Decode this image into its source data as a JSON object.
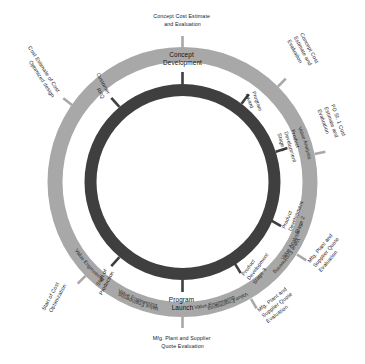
{
  "diagram": {
    "type": "concentric-process-wheel",
    "title": "Concept Cost Estimate and Evaluation",
    "colors": {
      "outer_ring": "#a8a8a8",
      "inner_ring": "#3f3f3f",
      "background": "#ffffff",
      "text": "#1a1a1a"
    },
    "outside_labels": [
      {
        "id": "top",
        "text_lines": [
          "Concept Cost Estimate",
          "and Evaluation"
        ],
        "angle_deg": 0,
        "rotation_deg": 0
      },
      {
        "id": "upper-right",
        "text_lines": [
          "Concept Cost",
          "Estimate and",
          "Evaluation"
        ],
        "angle_deg": 45,
        "rotation_deg": -60
      },
      {
        "id": "right",
        "text_lines": [
          "PD St. 1 Cost",
          "Estimate and",
          "Evaluation"
        ],
        "angle_deg": 78,
        "rotation_deg": -68
      },
      {
        "id": "lower-right",
        "text_lines": [
          "Mfg. Plant and",
          "Supplier Quote",
          "Evaluation"
        ],
        "angle_deg": 122,
        "rotation_deg": 52
      },
      {
        "id": "lower-right-2",
        "text_lines": [
          "Mfg. Plant and",
          "Supplier Quote",
          "Evaluation"
        ],
        "angle_deg": 150,
        "rotation_deg": 40
      },
      {
        "id": "bottom",
        "text_lines": [
          "Mfg. Plant and Supplier",
          "Quote Evaluation"
        ],
        "angle_deg": 180,
        "rotation_deg": 0
      },
      {
        "id": "lower-left",
        "text_lines": [
          "Start of Cost",
          "Optimization"
        ],
        "angle_deg": 224,
        "rotation_deg": -60
      },
      {
        "id": "upper-left",
        "text_lines": [
          "Cost Estimate of Cost",
          "Optimized design"
        ],
        "angle_deg": 305,
        "rotation_deg": 55
      }
    ],
    "outer_ring_labels": [
      {
        "text": "Value Engineering",
        "angle_deg": 28
      },
      {
        "text": "Value Engineering",
        "angle_deg": 62
      },
      {
        "text": "Value Engineering",
        "angle_deg": 103
      },
      {
        "text": "Value Engineering",
        "angle_deg": 143
      },
      {
        "text": "Value Engineering",
        "angle_deg": 168
      },
      {
        "text": "Value Engineering",
        "angle_deg": 205
      },
      {
        "text": "Value Analysis",
        "angle_deg": 262
      },
      {
        "text": "Value Analysis",
        "angle_deg": 325
      }
    ],
    "inner_ring_stages": [
      {
        "text_lines": [
          "Concept",
          "Development"
        ],
        "angle_deg": 0
      },
      {
        "text_lines": [
          "Program",
          "Award"
        ],
        "angle_deg": 37
      },
      {
        "text_lines": [
          "Product",
          "Development",
          "Stage 1"
        ],
        "angle_deg": 72
      },
      {
        "text_lines": [
          "Product",
          "Development",
          "Stage 2"
        ],
        "angle_deg": 116
      },
      {
        "text_lines": [
          "Product",
          "Development",
          "Stage 3"
        ],
        "angle_deg": 148
      },
      {
        "text_lines": [
          "Program",
          "Launch"
        ],
        "angle_deg": 180
      },
      {
        "text_lines": [
          "Start of",
          "Production"
        ],
        "angle_deg": 230
      },
      {
        "text_lines": [
          "Customer",
          "RFQ"
        ],
        "angle_deg": 310
      }
    ]
  }
}
